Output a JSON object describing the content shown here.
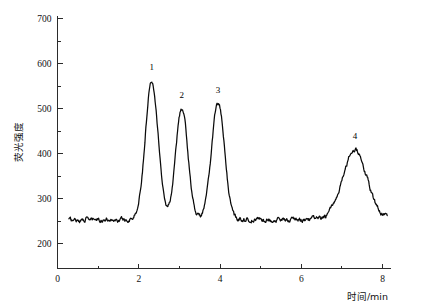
{
  "chart_data": {
    "type": "line",
    "title": "",
    "xlabel": "时间/min",
    "ylabel": "荧光强度",
    "xlim": [
      0,
      8.2
    ],
    "ylim": [
      190,
      700
    ],
    "grid": false,
    "legend_position": "none",
    "x_ticks_major": [
      0,
      2,
      4,
      6,
      8
    ],
    "x_ticks_minor": [
      1,
      3,
      5,
      7
    ],
    "x_tick_labels": [
      "0",
      "2",
      "4",
      "6",
      "8"
    ],
    "y_ticks_major": [
      200,
      300,
      400,
      500,
      600,
      700
    ],
    "y_ticks_minor": [
      250,
      350,
      450,
      550,
      650
    ],
    "y_tick_labels": [
      "200",
      "300",
      "400",
      "500",
      "600",
      "700"
    ],
    "baseline": 253,
    "noise_amplitude": 6,
    "series": [
      {
        "name": "fluorescence",
        "color": "#0a0a0a",
        "peaks": [
          {
            "label": "1",
            "retention_time": 2.32,
            "height": 562,
            "width": 0.16,
            "label_y": 585
          },
          {
            "label": "2",
            "retention_time": 3.06,
            "height": 500,
            "width": 0.15,
            "label_y": 523
          },
          {
            "label": "3",
            "retention_time": 3.95,
            "height": 512,
            "width": 0.16,
            "label_y": 535
          },
          {
            "label": "4",
            "retention_time": 7.32,
            "height": 408,
            "width": 0.3,
            "label_y": 432
          }
        ]
      }
    ]
  },
  "axes": {
    "y_axis_title": "荧光强度",
    "x_axis_title": "时间/min"
  }
}
